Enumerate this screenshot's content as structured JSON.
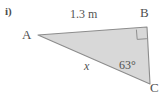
{
  "figure": {
    "item_label": "i)",
    "shape": "right-triangle",
    "fill_color": "#d8d8d8",
    "stroke_color": "#8c8c8c",
    "vertices": [
      {
        "name": "A",
        "label": "A",
        "x": 38,
        "y": 35
      },
      {
        "name": "B",
        "label": "B",
        "x": 147,
        "y": 27
      },
      {
        "name": "C",
        "label": "C",
        "x": 150,
        "y": 84
      }
    ],
    "right_angle_at": "B",
    "side_labels": [
      {
        "name": "side-ab",
        "label": "1.3 m",
        "between": "A-B"
      },
      {
        "name": "side-ac",
        "label": "x",
        "between": "A-C"
      }
    ],
    "angle_labels": [
      {
        "name": "angle-c",
        "label": "63°",
        "at": "C"
      }
    ]
  }
}
